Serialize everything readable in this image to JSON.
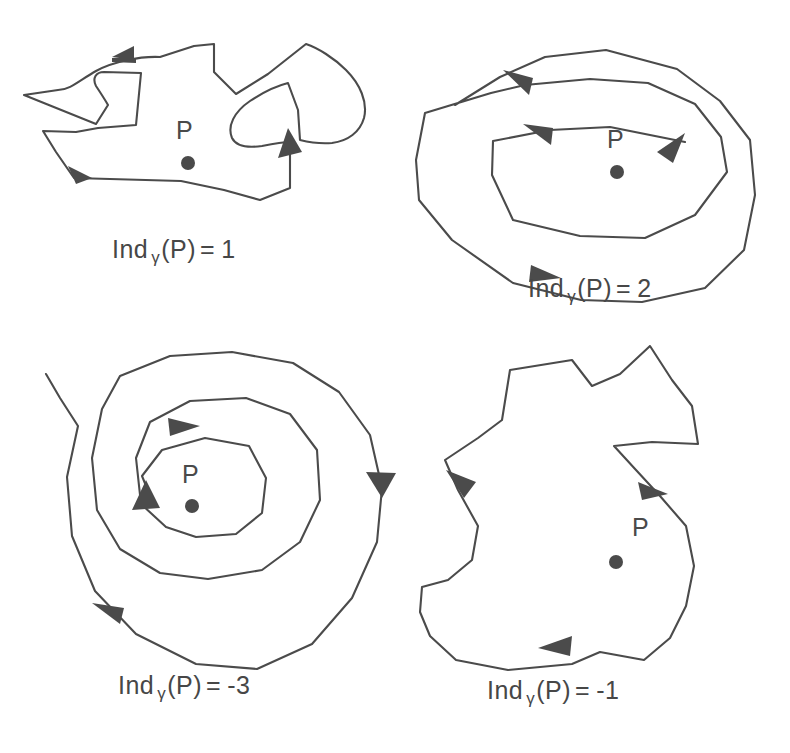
{
  "figure": {
    "background_color": "#ffffff",
    "ink_color": "#4b4b4b",
    "point_color": "#4a4a4a"
  },
  "panels": [
    {
      "id": "panel-1",
      "point_label": "P",
      "caption": {
        "prefix": "Ind",
        "subscript": "γ",
        "argument": "(P)",
        "equals": "=",
        "value": "1",
        "full_text": "Ind γ (P) = 1"
      },
      "index_value": 1,
      "orientation": "counterclockwise",
      "description": "irregular blob with a left spike and a right inner loop, one net positive turn",
      "arrow_count": 3
    },
    {
      "id": "panel-2",
      "point_label": "P",
      "caption": {
        "prefix": "Ind",
        "subscript": "γ",
        "argument": "(P)",
        "equals": "=",
        "value": "2",
        "full_text": "Ind γ (P) = 2"
      },
      "index_value": 2,
      "orientation": "counterclockwise",
      "description": "double spiral winding twice counterclockwise around P",
      "arrow_count": 3
    },
    {
      "id": "panel-3",
      "point_label": "P",
      "caption": {
        "prefix": "Ind",
        "subscript": "γ",
        "argument": "(P)",
        "equals": "=",
        "value": "-3",
        "full_text": "Ind γ (P) = -3"
      },
      "index_value": -3,
      "orientation": "clockwise",
      "description": "triple spiral winding three times clockwise around P",
      "arrow_count": 3
    },
    {
      "id": "panel-4",
      "point_label": "P",
      "caption": {
        "prefix": "Ind",
        "subscript": "γ",
        "argument": "(P)",
        "equals": "=",
        "value": "-1",
        "full_text": "Ind γ (P) = -1"
      },
      "index_value": -1,
      "orientation": "clockwise",
      "description": "S-shaped simple closed polygon traversed clockwise around P",
      "arrow_count": 3
    }
  ]
}
